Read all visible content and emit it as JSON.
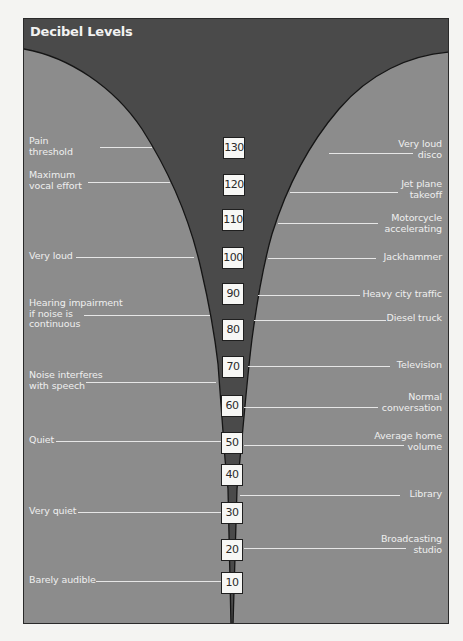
{
  "title": "Decibel Levels",
  "colors": {
    "funnel": "#4a4a4a",
    "background": "#8c8c8c",
    "label_text": "#efefef",
    "box_fill": "#f7f7f5",
    "frame_border": "#2a2a2a"
  },
  "scale": {
    "unit": "dB",
    "levels": [
      "130",
      "120",
      "110",
      "100",
      "90",
      "80",
      "70",
      "60",
      "50",
      "40",
      "30",
      "20",
      "10"
    ]
  },
  "left_labels": [
    {
      "text": "Pain\nthreshold",
      "level": "130"
    },
    {
      "text": "Maximum\nvocal effort",
      "level": "120"
    },
    {
      "text": "Very loud",
      "level": "100"
    },
    {
      "text": "Hearing impairment\nif noise is\ncontinuous",
      "level": "85"
    },
    {
      "text": "Noise interferes\nwith speech",
      "level": "65"
    },
    {
      "text": "Quiet",
      "level": "50"
    },
    {
      "text": "Very quiet",
      "level": "30"
    },
    {
      "text": "Barely audible",
      "level": "10"
    }
  ],
  "right_labels": [
    {
      "text": "Very loud\ndisco",
      "level": "130"
    },
    {
      "text": "Jet plane\ntakeoff",
      "level": "120"
    },
    {
      "text": "Motorcycle\naccelerating",
      "level": "110"
    },
    {
      "text": "Jackhammer",
      "level": "100"
    },
    {
      "text": "Heavy city traffic",
      "level": "90"
    },
    {
      "text": "Diesel truck",
      "level": "80"
    },
    {
      "text": "Television",
      "level": "70"
    },
    {
      "text": "Normal\nconversation",
      "level": "60"
    },
    {
      "text": "Average home\nvolume",
      "level": "50"
    },
    {
      "text": "Library",
      "level": "35"
    },
    {
      "text": "Broadcasting\nstudio",
      "level": "20"
    }
  ]
}
